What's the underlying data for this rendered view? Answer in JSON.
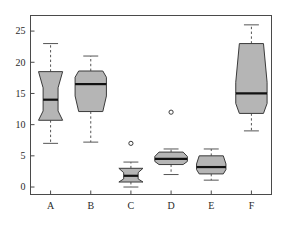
{
  "chart_data": {
    "type": "boxplot",
    "title": "",
    "subtitle": "",
    "xlabel": "",
    "ylabel": "",
    "categories": [
      "A",
      "B",
      "C",
      "D",
      "E",
      "F"
    ],
    "ylim": [
      -1.2,
      27.5
    ],
    "yticks": [
      0,
      5,
      10,
      15,
      20,
      25
    ],
    "ytick_labels": [
      "0",
      "5",
      "10",
      "15",
      "20",
      "25"
    ],
    "grid": false,
    "legend": "none",
    "notched": true,
    "box_fill": "#b5b5b5",
    "box_stroke": "#3a3a3a",
    "median_color": "#111111",
    "whisker_color": "#555555",
    "frame_color": "#4a4a4a",
    "boxes": [
      {
        "label": "A",
        "whisker_low": 7.0,
        "q1": 10.7,
        "notch_low": 12.2,
        "median": 14.0,
        "notch_high": 15.9,
        "q3": 18.5,
        "whisker_high": 23.0,
        "notch_inset": 0.38,
        "outliers": []
      },
      {
        "label": "B",
        "whisker_low": 7.2,
        "q1": 12.1,
        "notch_low": 14.6,
        "median": 16.5,
        "notch_high": 17.6,
        "q3": 18.6,
        "whisker_high": 21.0,
        "notch_inset": -0.3,
        "outliers": []
      },
      {
        "label": "C",
        "whisker_low": 0.0,
        "q1": 0.8,
        "notch_low": 1.3,
        "median": 1.8,
        "notch_high": 2.3,
        "q3": 3.0,
        "whisker_high": 4.0,
        "notch_inset": 0.4,
        "outliers": [
          7.0
        ]
      },
      {
        "label": "D",
        "whisker_low": 2.0,
        "q1": 3.6,
        "notch_low": 4.1,
        "median": 4.5,
        "notch_high": 4.9,
        "q3": 5.6,
        "whisker_high": 6.1,
        "notch_inset": -0.35,
        "outliers": [
          12.0
        ]
      },
      {
        "label": "E",
        "whisker_low": 1.1,
        "q1": 2.1,
        "notch_low": 2.8,
        "median": 3.2,
        "notch_high": 3.7,
        "q3": 5.0,
        "whisker_high": 6.1,
        "notch_inset": -0.22,
        "outliers": []
      },
      {
        "label": "F",
        "whisker_low": 9.0,
        "q1": 11.8,
        "notch_low": 13.4,
        "median": 15.0,
        "notch_high": 16.8,
        "q3": 23.0,
        "whisker_high": 26.0,
        "notch_inset": -0.3,
        "outliers": []
      }
    ]
  }
}
